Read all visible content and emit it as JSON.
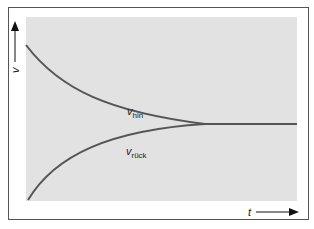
{
  "diagram": {
    "colors": {
      "background": "#ffffff",
      "frame": "#555555",
      "plot_fill": "#e2e2e2",
      "curve": "#555555",
      "axis": "#111111"
    },
    "y_axis": {
      "label": "v"
    },
    "x_axis": {
      "label": "t"
    },
    "curves": [
      {
        "name": "v_hin",
        "label_main": "v",
        "label_sub": "hin",
        "trend": "decreasing, converges to steady value"
      },
      {
        "name": "v_rueck",
        "label_main": "v",
        "label_sub": "rück",
        "trend": "increasing, converges to steady value"
      }
    ]
  }
}
